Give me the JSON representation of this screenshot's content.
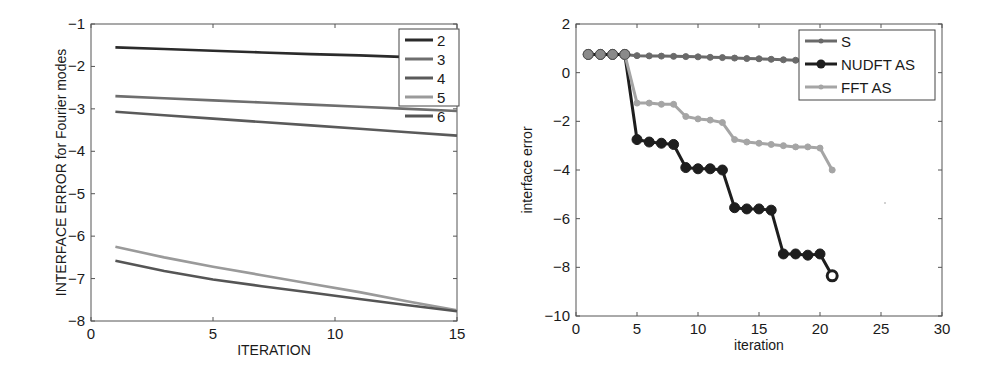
{
  "chart_data": [
    {
      "type": "line",
      "title": "",
      "xlabel": "ITERATION",
      "ylabel": "INTERFACE ERROR for Fourier modes",
      "xlim": [
        0,
        15
      ],
      "ylim": [
        -8,
        -1
      ],
      "xticks": [
        0,
        5,
        10,
        15
      ],
      "yticks": [
        -8,
        -7,
        -6,
        -5,
        -4,
        -3,
        -2,
        -1
      ],
      "grid": false,
      "legend_position": "upper right",
      "x": [
        1,
        3,
        5,
        7,
        9,
        11,
        13,
        15
      ],
      "series": [
        {
          "name": "2",
          "color": "#2b2b2b",
          "values": [
            -1.55,
            -1.59,
            -1.63,
            -1.67,
            -1.71,
            -1.74,
            -1.78,
            -1.82
          ]
        },
        {
          "name": "3",
          "color": "#6e6e6e",
          "values": [
            -2.7,
            -2.75,
            -2.8,
            -2.85,
            -2.9,
            -2.95,
            -3.0,
            -3.05
          ]
        },
        {
          "name": "4",
          "color": "#5a5a5a",
          "values": [
            -3.07,
            -3.15,
            -3.23,
            -3.31,
            -3.39,
            -3.47,
            -3.55,
            -3.63
          ]
        },
        {
          "name": "5",
          "color": "#9a9a9a",
          "values": [
            -6.25,
            -6.5,
            -6.72,
            -6.92,
            -7.12,
            -7.32,
            -7.54,
            -7.75
          ]
        },
        {
          "name": "6",
          "color": "#555555",
          "values": [
            -6.58,
            -6.82,
            -7.02,
            -7.18,
            -7.33,
            -7.48,
            -7.63,
            -7.77
          ]
        }
      ]
    },
    {
      "type": "line",
      "title": "",
      "xlabel": "iteration",
      "ylabel": "interface error",
      "xlim": [
        0,
        30
      ],
      "ylim": [
        -10,
        2
      ],
      "xticks": [
        0,
        5,
        10,
        15,
        20,
        25,
        30
      ],
      "yticks": [
        -10,
        -8,
        -6,
        -4,
        -2,
        0,
        2
      ],
      "grid": false,
      "legend_position": "upper right",
      "series": [
        {
          "name": "S",
          "color": "#6a6a6a",
          "marker": "small-dot",
          "x": [
            1,
            2,
            3,
            4,
            5,
            6,
            7,
            8,
            9,
            10,
            11,
            12,
            13,
            14,
            15,
            16,
            17,
            18,
            19,
            20
          ],
          "values": [
            0.75,
            0.75,
            0.75,
            0.75,
            0.7,
            0.69,
            0.68,
            0.67,
            0.66,
            0.65,
            0.63,
            0.62,
            0.6,
            0.58,
            0.57,
            0.55,
            0.53,
            0.51,
            0.48,
            0.45
          ]
        },
        {
          "name": "NUDFT AS",
          "color": "#1e1e1e",
          "marker": "large-circle",
          "x": [
            1,
            2,
            3,
            4,
            5,
            6,
            7,
            8,
            9,
            10,
            11,
            12,
            13,
            14,
            15,
            16,
            17,
            18,
            19,
            20,
            21
          ],
          "values": [
            0.75,
            0.75,
            0.75,
            0.75,
            -2.75,
            -2.85,
            -2.9,
            -2.95,
            -3.9,
            -3.95,
            -3.95,
            -4.0,
            -5.55,
            -5.6,
            -5.6,
            -5.65,
            -7.45,
            -7.45,
            -7.5,
            -7.45,
            -8.35
          ]
        },
        {
          "name": "FFT AS",
          "color": "#a5a5a5",
          "marker": "small-dot",
          "x": [
            4,
            5,
            6,
            7,
            8,
            9,
            10,
            11,
            12,
            13,
            14,
            15,
            16,
            17,
            18,
            19,
            20,
            21
          ],
          "values": [
            0.75,
            -1.25,
            -1.25,
            -1.3,
            -1.3,
            -1.8,
            -1.9,
            -1.95,
            -2.05,
            -2.75,
            -2.85,
            -2.9,
            -2.95,
            -3.0,
            -3.05,
            -3.05,
            -3.1,
            -4.0
          ]
        }
      ]
    }
  ]
}
